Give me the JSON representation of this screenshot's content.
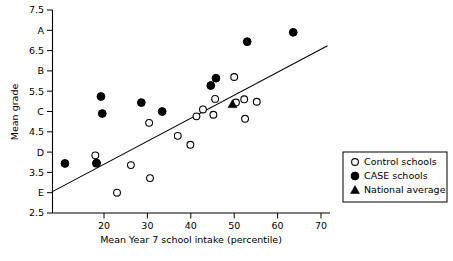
{
  "chart_data": {
    "type": "scatter",
    "title": "",
    "xlabel": "Mean Year 7 school intake (percentile)",
    "ylabel": "Mean grade",
    "xlim": [
      8,
      74
    ],
    "ylim": [
      2.5,
      7.5
    ],
    "grid": false,
    "xticks": [
      20,
      30,
      40,
      50,
      60,
      70
    ],
    "xtick_labels": [
      "20",
      "30",
      "40",
      "50",
      "60",
      "70"
    ],
    "yticks": [
      2.5,
      3,
      3.5,
      4,
      4.5,
      5,
      5.5,
      6,
      6.5,
      7,
      7.5
    ],
    "ytick_labels": [
      "2.5",
      "E",
      "3.5",
      "D",
      "4.5",
      "C",
      "5.5",
      "B",
      "6.5",
      "A",
      "7.5"
    ],
    "legend_position": "right",
    "series": [
      {
        "name": "Control schools",
        "marker": "open-circle",
        "points": [
          [
            18.0,
            3.92
          ],
          [
            18.2,
            3.72
          ],
          [
            23.0,
            3.0
          ],
          [
            26.2,
            3.68
          ],
          [
            30.4,
            4.72
          ],
          [
            30.6,
            3.36
          ],
          [
            37.0,
            4.4
          ],
          [
            39.9,
            4.18
          ],
          [
            41.3,
            4.88
          ],
          [
            42.8,
            5.05
          ],
          [
            45.2,
            4.92
          ],
          [
            45.6,
            5.31
          ],
          [
            50.0,
            5.85
          ],
          [
            50.4,
            5.22
          ],
          [
            52.3,
            5.3
          ],
          [
            52.5,
            4.82
          ],
          [
            55.2,
            5.24
          ]
        ]
      },
      {
        "name": "CASE schools",
        "marker": "filled-circle",
        "points": [
          [
            11.0,
            3.72
          ],
          [
            18.3,
            3.73
          ],
          [
            19.3,
            5.37
          ],
          [
            19.6,
            4.95
          ],
          [
            28.6,
            5.22
          ],
          [
            33.4,
            5.0
          ],
          [
            44.6,
            5.64
          ],
          [
            45.8,
            5.82
          ],
          [
            53.0,
            6.72
          ],
          [
            63.6,
            6.95
          ]
        ]
      },
      {
        "name": "National average",
        "marker": "filled-triangle",
        "points": [
          [
            49.6,
            5.18
          ]
        ]
      }
    ],
    "trendline": {
      "x": [
        8.0,
        71.5
      ],
      "y": [
        3.02,
        6.62
      ]
    }
  },
  "legend": {
    "items": [
      {
        "label": "Control schools",
        "marker": "open-circle"
      },
      {
        "label": "CASE schools",
        "marker": "filled-circle"
      },
      {
        "label": "National average",
        "marker": "filled-triangle"
      }
    ]
  },
  "axis": {
    "x_title": "Mean Year 7 school intake (percentile)",
    "y_title": "Mean grade"
  }
}
